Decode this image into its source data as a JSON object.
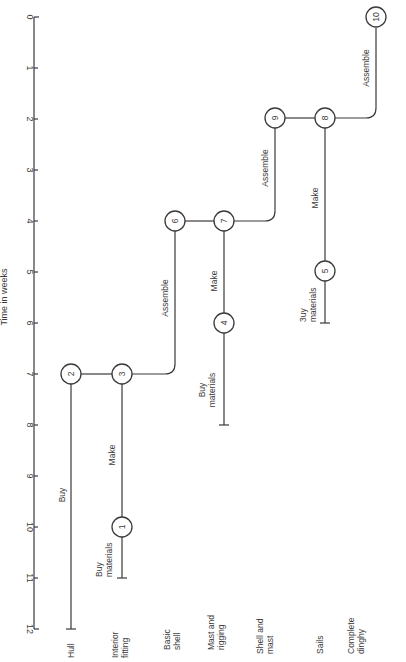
{
  "diagram": {
    "title": "Time in weeks",
    "axis": {
      "label": "Time in weeks",
      "ticks": [
        "0",
        "1",
        "2",
        "3",
        "4",
        "5",
        "6",
        "7",
        "8",
        "9",
        "10",
        "11",
        "12"
      ]
    },
    "rows": [
      {
        "id": "hull",
        "lines": [
          "Hull"
        ]
      },
      {
        "id": "interior-fitting",
        "lines": [
          "Interior",
          "fitting"
        ]
      },
      {
        "id": "basic-shell",
        "lines": [
          "Basic",
          "shell"
        ]
      },
      {
        "id": "mast-and-rigging",
        "lines": [
          "Mast and",
          "rigging"
        ]
      },
      {
        "id": "shell-and-mast",
        "lines": [
          "Shell and",
          "mast"
        ]
      },
      {
        "id": "sails",
        "lines": [
          "Sails"
        ]
      },
      {
        "id": "complete-dinghy",
        "lines": [
          "Complete",
          "dinghy"
        ]
      }
    ],
    "nodes": [
      {
        "id": "1",
        "label": "1",
        "row": "interior-fitting",
        "week": 10
      },
      {
        "id": "2",
        "label": "2",
        "row": "hull",
        "week": 7
      },
      {
        "id": "3",
        "label": "3",
        "row": "interior-fitting",
        "week": 7
      },
      {
        "id": "4",
        "label": "4",
        "row": "mast-and-rigging",
        "week": 6
      },
      {
        "id": "5",
        "label": "5",
        "row": "sails",
        "week": 5
      },
      {
        "id": "6",
        "label": "6",
        "row": "basic-shell",
        "week": 4
      },
      {
        "id": "7",
        "label": "7",
        "row": "mast-and-rigging",
        "week": 4
      },
      {
        "id": "8",
        "label": "8",
        "row": "sails",
        "week": 2
      },
      {
        "id": "9",
        "label": "9",
        "row": "shell-and-mast",
        "week": 2
      },
      {
        "id": "10",
        "label": "10",
        "row": "complete-dinghy",
        "week": 0
      }
    ],
    "activities": {
      "hull_buy": {
        "label": "Buy",
        "from_week": 12,
        "to_week": 7
      },
      "interior_buy": {
        "lines": [
          "Buy",
          "materials"
        ],
        "from_week": 11,
        "to_week": 10
      },
      "interior_make": {
        "label": "Make",
        "from_week": 10,
        "to_week": 7
      },
      "basic_shell_assemble": {
        "label": "Assemble",
        "from_week": 7,
        "to_week": 4
      },
      "mast_buy": {
        "lines": [
          "Buy",
          "materials"
        ],
        "from_week": 8,
        "to_week": 6
      },
      "mast_make": {
        "label": "Make",
        "from_week": 6,
        "to_week": 4
      },
      "shell_mast_assemble": {
        "label": "Assemble",
        "from_week": 4,
        "to_week": 2
      },
      "sails_buy": {
        "lines": [
          "3uy",
          "materials"
        ],
        "from_week": 6,
        "to_week": 5
      },
      "sails_make": {
        "label": "Make",
        "from_week": 5,
        "to_week": 2
      },
      "dinghy_assemble": {
        "label": "Assemble",
        "from_week": 2,
        "to_week": 0
      }
    },
    "colors": {
      "ink": "#3a3a3a",
      "background": "#ffffff"
    }
  }
}
